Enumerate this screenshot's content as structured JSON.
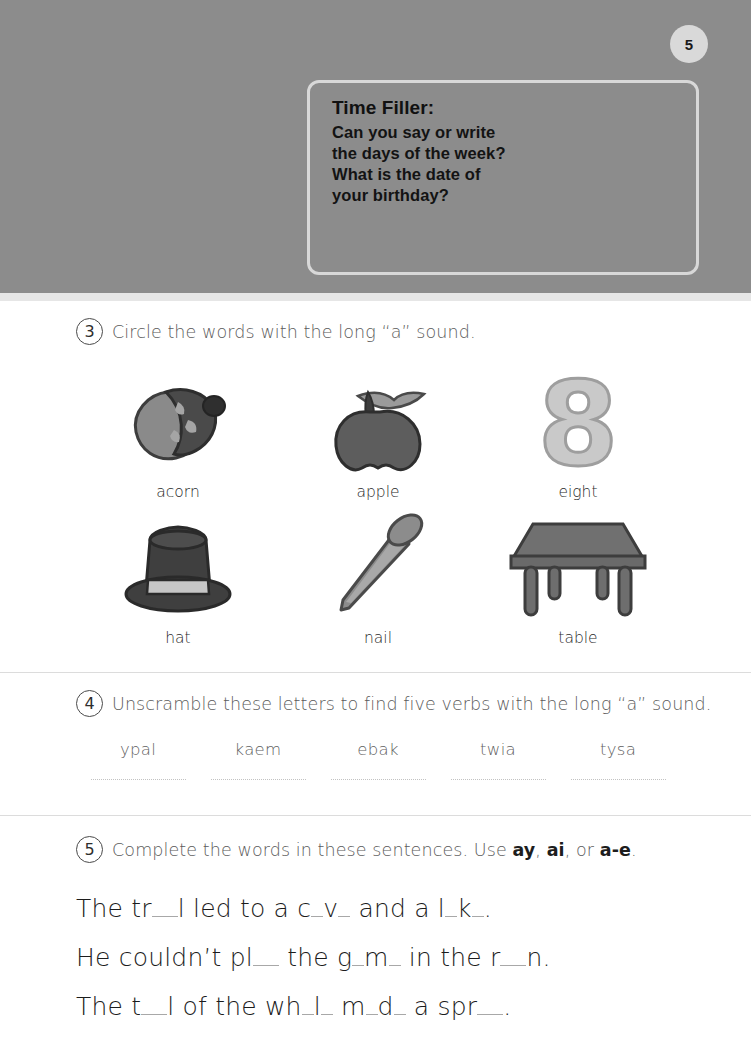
{
  "page": {
    "number": "5"
  },
  "time_filler": {
    "title": "Time Filler:",
    "lines": [
      "Can you say or write",
      "the days of the week?",
      "What is the date of",
      "your birthday?"
    ]
  },
  "q3": {
    "number": "3",
    "instruction": "Circle the words with the long “a” sound.",
    "items": [
      {
        "label": "acorn",
        "icon": "acorn-icon"
      },
      {
        "label": "apple",
        "icon": "apple-icon"
      },
      {
        "label": "eight",
        "icon": "number-eight-icon"
      },
      {
        "label": "hat",
        "icon": "top-hat-icon"
      },
      {
        "label": "nail",
        "icon": "nail-icon"
      },
      {
        "label": "table",
        "icon": "table-icon"
      }
    ]
  },
  "q4": {
    "number": "4",
    "instruction": "Unscramble these letters to find five verbs with the long “a” sound.",
    "words": [
      "ypal",
      "kaem",
      "ebak",
      "twia",
      "tysa"
    ]
  },
  "q5": {
    "number": "5",
    "instruction_pre": "Complete the words in these sentences. Use ",
    "opt1": "ay",
    "sep1": ", ",
    "opt2": "ai",
    "sep2": ", or ",
    "opt3": "a-e",
    "instruction_post": ".",
    "sentences": [
      {
        "parts": [
          "The tr",
          "l led to a c",
          "v",
          " and a l",
          "k",
          "."
        ],
        "blanks": [
          "b2",
          "b1",
          "b1",
          "b1",
          "b1"
        ]
      },
      {
        "parts": [
          "He couldn’t pl",
          " the g",
          "m",
          " in the r",
          "n.",
          ""
        ],
        "blanks": [
          "b2",
          "b1",
          "b1",
          "b2",
          ""
        ]
      },
      {
        "parts": [
          "The t",
          "l of the wh",
          "l",
          " m",
          "d",
          " a spr",
          "."
        ],
        "blanks": [
          "b2",
          "b1",
          "b1",
          "b1",
          "b1",
          "b2"
        ]
      }
    ],
    "sentence_text": [
      "The tr__l led to a c_v_ and a l_k_.",
      "He couldn’t pl__ the g_m_ in the r__n.",
      "The t__l of the wh_l_ m_d_ a spr__."
    ]
  },
  "colors": {
    "header_gray": "#8c8c8c",
    "badge_gray": "#d9d9d9",
    "box_border": "#d8d8d8",
    "divider": "#dcdcdc",
    "art_dark": "#4d4d4d",
    "art_mid": "#7a7a7a",
    "art_light": "#bdbdbd"
  }
}
